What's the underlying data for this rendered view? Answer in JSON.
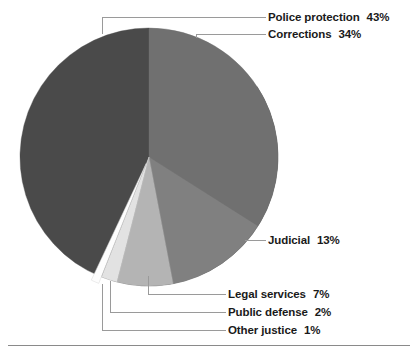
{
  "chart_data": {
    "type": "pie",
    "title": "",
    "subtitle": "",
    "xlabel": "",
    "ylabel": "",
    "legend_position": "callout-labels",
    "grid": false,
    "unit": "%",
    "start_angle_deg": 0,
    "direction": "clockwise",
    "categories": [
      "Police protection",
      "Corrections",
      "Judicial",
      "Legal services",
      "Public defense",
      "Other justice"
    ],
    "values": [
      43,
      34,
      13,
      7,
      2,
      1
    ],
    "slices": [
      {
        "label": "Police protection",
        "value": 43,
        "value_text": "43%",
        "color": "#4a4a4a",
        "exploded": false,
        "start_deg": 57,
        "end_deg": 360
      },
      {
        "label": "Corrections",
        "value": 34,
        "value_text": "34%",
        "color": "#707070",
        "exploded": false,
        "start_deg": 0,
        "end_deg": 122.4
      },
      {
        "label": "Judicial",
        "value": 13,
        "value_text": "13%",
        "color": "#808080",
        "exploded": false,
        "start_deg": 122.4,
        "end_deg": 169.2
      },
      {
        "label": "Legal services",
        "value": 7,
        "value_text": "7%",
        "color": "#b4b4b4",
        "exploded": false,
        "start_deg": 169.2,
        "end_deg": 194.4
      },
      {
        "label": "Public defense",
        "value": 2,
        "value_text": "2%",
        "color": "#e2e2e2",
        "exploded": false,
        "start_deg": 194.4,
        "end_deg": 201.6
      },
      {
        "label": "Other justice",
        "value": 1,
        "value_text": "1%",
        "color": "#fdfdfd",
        "exploded": true,
        "start_deg": 201.6,
        "end_deg": 205.2
      }
    ]
  },
  "labels": {
    "police": {
      "name": "Police protection",
      "value": "43%"
    },
    "corrections": {
      "name": "Corrections",
      "value": "34%"
    },
    "judicial": {
      "name": "Judicial",
      "value": "13%"
    },
    "legal_services": {
      "name": "Legal services",
      "value": "7%"
    },
    "public_defense": {
      "name": "Public defense",
      "value": "2%"
    },
    "other_justice": {
      "name": "Other justice",
      "value": "1%"
    }
  },
  "colors": {
    "police": "#4a4a4a",
    "corrections": "#707070",
    "judicial": "#808080",
    "legal_services": "#b4b4b4",
    "public_defense": "#e2e2e2",
    "other_justice": "#fdfdfd",
    "leader_line": "#9a9a9a",
    "text": "#1a1a1a",
    "rule": "#8a8a8a",
    "background": "#ffffff"
  }
}
